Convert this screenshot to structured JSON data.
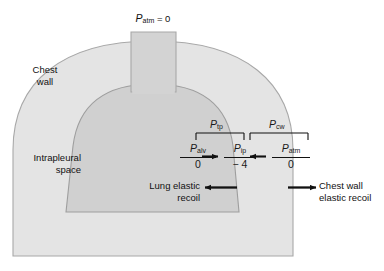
{
  "figure": {
    "title_top": "Patm = 0",
    "top_label": {
      "symbol": "P",
      "subscript": "atm",
      "equals": " = 0"
    },
    "labels": {
      "chest_wall": "Chest\nwall",
      "chest_wall_line1": "Chest",
      "chest_wall_line2": "wall",
      "intrapleural_line1": "Intrapleural",
      "intrapleural_line2": "space",
      "lung_recoil_line1": "Lung elastic",
      "lung_recoil_line2": "recoil",
      "chest_recoil_line1": "Chest wall",
      "chest_recoil_line2": "elastic recoil"
    },
    "brackets": [
      {
        "id": "transpulmonary",
        "symbol": "P",
        "subscript": "tp"
      },
      {
        "id": "chest-wall",
        "symbol": "P",
        "subscript": "cw"
      }
    ],
    "pressures": [
      {
        "id": "alveolar",
        "symbol": "P",
        "subscript": "alv",
        "value": "0"
      },
      {
        "id": "intrapleural",
        "symbol": "P",
        "subscript": "ip",
        "value": "− 4"
      },
      {
        "id": "atmospheric",
        "symbol": "P",
        "subscript": "atm",
        "value": "0"
      }
    ],
    "arrows": [
      {
        "id": "alv-to-ip",
        "direction": "right"
      },
      {
        "id": "atm-to-ip",
        "direction": "left"
      },
      {
        "id": "lung-elastic-recoil",
        "direction": "left"
      },
      {
        "id": "chest-wall-elastic-recoil",
        "direction": "right"
      }
    ],
    "colors": {
      "chest_wall_fill": "#e4e4e4",
      "lung_fill": "#d0d0d0",
      "trachea_fill": "#d3d3d3",
      "outline": "#9a9a9a",
      "text": "#111111",
      "background": "#ffffff"
    }
  }
}
